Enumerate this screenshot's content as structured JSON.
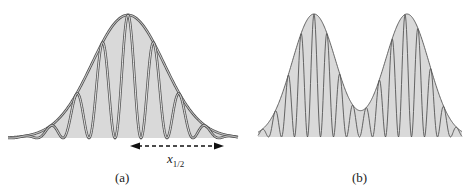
{
  "figure": {
    "panels": [
      {
        "id": "a",
        "label": "(a)",
        "description": "Single Gaussian envelope with cos-squared interference fringes",
        "envelope": {
          "center_x": 128,
          "peak_y": 15,
          "baseline_y": 138,
          "sigma_px": 36,
          "x_start": 8,
          "x_end": 238
        },
        "fringe_period_px": 26,
        "annotation": {
          "symbol": "x",
          "subscript": "1/2",
          "arrow": "double-headed dashed",
          "arrow_x_start": 130,
          "arrow_x_end": 224,
          "arrow_y": 146
        }
      },
      {
        "id": "b",
        "label": "(b)",
        "description": "Two separated Gaussian envelopes with denser cos-squared fringes",
        "envelopes": [
          {
            "center_x": 314,
            "peak_y": 14,
            "baseline_y": 137,
            "sigma_px": 22
          },
          {
            "center_x": 407,
            "peak_y": 14,
            "baseline_y": 137,
            "sigma_px": 22
          }
        ],
        "x_start": 258,
        "x_end": 462,
        "fringe_period_px": 13
      }
    ],
    "colors": {
      "fill": "#d9d9d9",
      "stroke": "#555555",
      "background": "#ffffff",
      "text": "#222222"
    }
  }
}
